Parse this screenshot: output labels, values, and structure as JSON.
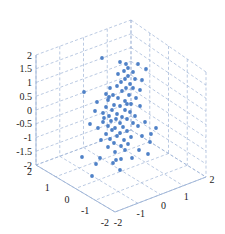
{
  "chart_data": {
    "type": "scatter3d",
    "title": "",
    "xlabel": "",
    "ylabel": "",
    "zlabel": "",
    "grid": true,
    "legend": null,
    "marker_color": "#4f81c7",
    "grid_color": "#9db3d6",
    "xlim": [
      -2,
      2
    ],
    "ylim": [
      -2,
      2
    ],
    "zlim": [
      -2,
      2
    ],
    "x_ticks": [
      "-2",
      "-1",
      "0",
      "1",
      "2"
    ],
    "y_ticks": [
      "-2",
      "-1",
      "0",
      "1",
      "2"
    ],
    "z_ticks": [
      "-2",
      "-1.5",
      "-1",
      "-0.5",
      "0",
      "0.5",
      "1",
      "1.5",
      "2"
    ],
    "points_screen_px": [
      [
        102,
        58
      ],
      [
        120,
        62
      ],
      [
        126,
        64
      ],
      [
        138,
        64
      ],
      [
        128,
        68
      ],
      [
        124,
        71
      ],
      [
        133,
        72
      ],
      [
        146,
        69
      ],
      [
        118,
        74
      ],
      [
        128,
        76
      ],
      [
        125,
        79
      ],
      [
        135,
        79
      ],
      [
        142,
        80
      ],
      [
        121,
        82
      ],
      [
        130,
        84
      ],
      [
        117,
        86
      ],
      [
        110,
        88
      ],
      [
        126,
        88
      ],
      [
        133,
        88
      ],
      [
        140,
        90
      ],
      [
        122,
        91
      ],
      [
        84,
        92
      ],
      [
        106,
        94
      ],
      [
        113,
        95
      ],
      [
        129,
        95
      ],
      [
        118,
        98
      ],
      [
        136,
        98
      ],
      [
        108,
        100
      ],
      [
        125,
        101
      ],
      [
        97,
        102
      ],
      [
        131,
        104
      ],
      [
        114,
        105
      ],
      [
        120,
        106
      ],
      [
        106,
        107
      ],
      [
        140,
        106
      ],
      [
        112,
        110
      ],
      [
        125,
        110
      ],
      [
        130,
        112
      ],
      [
        103,
        113
      ],
      [
        117,
        114
      ],
      [
        109,
        116
      ],
      [
        122,
        117
      ],
      [
        116,
        119
      ],
      [
        127,
        119
      ],
      [
        111,
        121
      ],
      [
        103,
        122
      ],
      [
        120,
        123
      ],
      [
        133,
        123
      ],
      [
        108,
        126
      ],
      [
        123,
        127
      ],
      [
        115,
        128
      ],
      [
        112,
        130
      ],
      [
        127,
        131
      ],
      [
        120,
        133
      ],
      [
        106,
        134
      ],
      [
        117,
        136
      ],
      [
        131,
        137
      ],
      [
        110,
        139
      ],
      [
        124,
        140
      ],
      [
        142,
        136
      ],
      [
        114,
        143
      ],
      [
        128,
        144
      ],
      [
        121,
        146
      ],
      [
        108,
        147
      ],
      [
        150,
        142
      ],
      [
        125,
        150
      ],
      [
        115,
        152
      ],
      [
        139,
        150
      ],
      [
        82,
        157
      ],
      [
        100,
        158
      ],
      [
        121,
        159
      ],
      [
        116,
        160
      ],
      [
        132,
        158
      ],
      [
        148,
        154
      ],
      [
        151,
        134
      ],
      [
        156,
        128
      ],
      [
        113,
        163
      ],
      [
        96,
        164
      ],
      [
        92,
        176
      ],
      [
        120,
        170
      ],
      [
        145,
        122
      ],
      [
        98,
        128
      ],
      [
        104,
        118
      ],
      [
        135,
        116
      ],
      [
        138,
        126
      ],
      [
        101,
        140
      ],
      [
        95,
        111
      ],
      [
        90,
        124
      ],
      [
        109,
        97
      ],
      [
        127,
        104
      ]
    ]
  }
}
